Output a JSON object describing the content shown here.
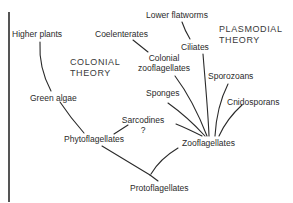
{
  "diagram": {
    "type": "phylogenetic-tree",
    "theories": {
      "colonial": {
        "line1": "COLONIAL",
        "line2": "THEORY"
      },
      "plasmodial": {
        "line1": "PLASMODIAL",
        "line2": "THEORY"
      }
    },
    "nodes": {
      "higher_plants": "Higher plants",
      "green_algae": "Green algae",
      "phytoflagellates": "Phytoflagellates",
      "protoflagellates": "Protoflagellates",
      "coelenterates": "Coelenterates",
      "colonial_zooflagellates_1": "Colonial",
      "colonial_zooflagellates_2": "zooflagellates",
      "lower_flatworms": "Lower flatworms",
      "ciliates": "Ciliates",
      "sponges": "Sponges",
      "sarcodines": "Sarcodines",
      "sarcodines_uncertain": "?",
      "sporozoans": "Sporozoans",
      "cnidosporans": "Cnidosporans",
      "zooflagellates": "Zooflagellates"
    },
    "edges": [
      [
        "Protoflagellates",
        "Phytoflagellates"
      ],
      [
        "Protoflagellates",
        "Zooflagellates"
      ],
      [
        "Phytoflagellates",
        "Green algae"
      ],
      [
        "Green algae",
        "Higher plants"
      ],
      [
        "Phytoflagellates",
        "Sarcodines"
      ],
      [
        "Zooflagellates",
        "Sarcodines"
      ],
      [
        "Zooflagellates",
        "Sponges"
      ],
      [
        "Zooflagellates",
        "Colonial zooflagellates"
      ],
      [
        "Colonial zooflagellates",
        "Coelenterates"
      ],
      [
        "Zooflagellates",
        "Ciliates"
      ],
      [
        "Ciliates",
        "Lower flatworms"
      ],
      [
        "Zooflagellates",
        "Sporozoans"
      ],
      [
        "Zooflagellates",
        "Cnidosporans"
      ]
    ]
  }
}
